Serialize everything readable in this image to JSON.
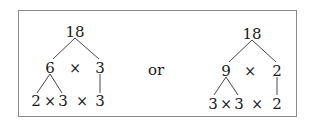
{
  "diagram": {
    "connector": "or",
    "trees": [
      {
        "root": "18",
        "level1": {
          "left": "6",
          "op": "×",
          "right": "3"
        },
        "level2": {
          "a": "2",
          "op1": "×",
          "b": "3",
          "op2": "×",
          "c": "3"
        }
      },
      {
        "root": "18",
        "level1": {
          "left": "9",
          "op": "×",
          "right": "2"
        },
        "level2": {
          "a": "3",
          "op1": "×",
          "b": "3",
          "op2": "×",
          "c": "2"
        }
      }
    ]
  }
}
